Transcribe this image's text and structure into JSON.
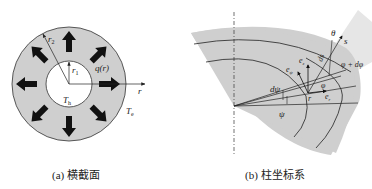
{
  "panel_a": {
    "caption": "(a) 横截面",
    "labels": {
      "r2": "r",
      "r2_sub": "2",
      "r1": "r",
      "r1_sub": "1",
      "q": "q(r)",
      "r_axis": "r",
      "Th": "T",
      "Th_sub": "h",
      "Te": "T",
      "Te_sub": "e"
    },
    "colors": {
      "annulus": "#cfcfcf",
      "core": "#ffffff",
      "arrow": "#111111"
    }
  },
  "panel_b": {
    "caption": "(b) 柱坐标系",
    "labels": {
      "theta": "θ",
      "s": "s",
      "ds": "ds",
      "phi_dphi": "φ + dφ",
      "e_psi": "e",
      "e_psi_sub": "ψ",
      "e_z": "e",
      "e_z_sub": "z",
      "e_r": "e",
      "e_r_sub": "r",
      "dpsi": "dψ",
      "psi": "ψ",
      "phi": "φ",
      "r_point": "r"
    },
    "colors": {
      "sector": "#cfcfcf",
      "band": "#e6e6e6",
      "line": "#222222"
    }
  }
}
